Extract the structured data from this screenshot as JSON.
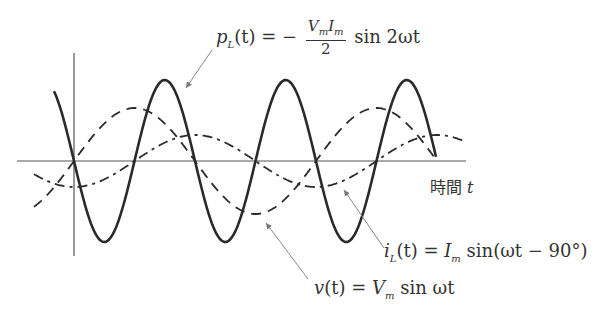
{
  "diagram": {
    "axis": {
      "time_label": "時間",
      "time_var": "t"
    },
    "labels": {
      "power": {
        "lhs": "p",
        "lhs_sub": "L",
        "lhs_arg": "(t) = −",
        "frac_num_a": "V",
        "frac_num_a_sub": "m",
        "frac_num_b": "I",
        "frac_num_b_sub": "m",
        "frac_den": "2",
        "rhs": "sin 2ωt"
      },
      "current": {
        "lhs": "i",
        "lhs_sub": "L",
        "eq": "(t) = ",
        "amp": "I",
        "amp_sub": "m",
        "rhs": " sin(ωt − 90°)"
      },
      "voltage": {
        "lhs": "v",
        "eq": "(t) = ",
        "amp": "V",
        "amp_sub": "m",
        "rhs": " sin ωt"
      }
    },
    "colors": {
      "curve": "#2a2a2a",
      "axis": "#555555",
      "leader": "#888888"
    },
    "curves": [
      {
        "name": "p_L(t)",
        "style": "solid",
        "expression": "-(Vm Im / 2) sin 2ωt"
      },
      {
        "name": "v(t)",
        "style": "dashed",
        "expression": "Vm sin ωt"
      },
      {
        "name": "i_L(t)",
        "style": "dash-dot",
        "expression": "Im sin(ωt - 90°)"
      }
    ]
  }
}
